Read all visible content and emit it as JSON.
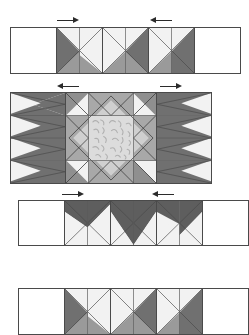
{
  "diagram": {
    "type": "quilt-piecing-diagram",
    "units_across": 5,
    "rows_shown": 4
  },
  "palette": {
    "background": "#ffffff",
    "light": "#f2f2f2",
    "light_print": "#e8e8e8",
    "medium": "#a8a8a8",
    "medium_dark": "#8f8f8f",
    "dark": "#707070",
    "darker": "#5e5e5e",
    "center_print_bg": "#dcdcdc",
    "center_print_motif": "#b4b4b4",
    "outline": "#4a4a4a",
    "seam": "#5a5a5a",
    "arrow": "#2b2b2b"
  },
  "rows": [
    {
      "name": "top-row",
      "label": "Row 1",
      "arrows": [
        {
          "name": "press-arrow-left",
          "direction": "right"
        },
        {
          "name": "press-arrow-right",
          "direction": "left"
        }
      ],
      "cells": [
        {
          "name": "background-square",
          "kind": "plain"
        },
        {
          "name": "flying-geese-unit",
          "kind": "geese-down"
        },
        {
          "name": "flying-geese-unit",
          "kind": "geese-down"
        },
        {
          "name": "flying-geese-unit",
          "kind": "geese-down"
        },
        {
          "name": "background-square",
          "kind": "plain"
        }
      ]
    },
    {
      "name": "center-row",
      "label": "Row 2",
      "arrows": [
        {
          "name": "press-arrow-left",
          "direction": "left"
        },
        {
          "name": "press-arrow-right",
          "direction": "right"
        }
      ],
      "cells": [
        {
          "name": "side-geese-column",
          "kind": "geese-right-stack"
        },
        {
          "name": "star-center-block",
          "kind": "square-in-square-print"
        },
        {
          "name": "side-geese-column",
          "kind": "geese-left-stack"
        }
      ]
    },
    {
      "name": "third-row",
      "label": "Row 3",
      "arrows": [
        {
          "name": "press-arrow-left",
          "direction": "right"
        },
        {
          "name": "press-arrow-right",
          "direction": "left"
        }
      ],
      "cells": [
        {
          "name": "background-square",
          "kind": "plain"
        },
        {
          "name": "flying-geese-unit",
          "kind": "geese-up"
        },
        {
          "name": "flying-geese-unit",
          "kind": "geese-up"
        },
        {
          "name": "flying-geese-unit",
          "kind": "geese-up"
        },
        {
          "name": "background-square",
          "kind": "plain"
        }
      ]
    },
    {
      "name": "bottom-row",
      "label": "Row 4",
      "arrows": [],
      "cells": [
        {
          "name": "background-square",
          "kind": "plain"
        },
        {
          "name": "flying-geese-unit",
          "kind": "geese-down"
        },
        {
          "name": "flying-geese-unit",
          "kind": "geese-down"
        },
        {
          "name": "flying-geese-unit",
          "kind": "geese-down"
        },
        {
          "name": "background-square",
          "kind": "plain"
        }
      ]
    }
  ]
}
